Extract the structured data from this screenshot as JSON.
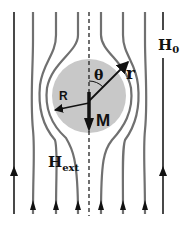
{
  "diagram": {
    "labels": {
      "applied_field": "H",
      "applied_field_sub": "0",
      "external_field": "H",
      "external_field_sub": "ext",
      "magnetization": "M",
      "sphere_radius": "R",
      "position_vector": "r",
      "polar_angle": "θ"
    },
    "colors": {
      "sphere_fill": "#c8c8c8",
      "field_line": "#6f6f6f",
      "outer_line": "#1a1a1a",
      "arrow": "#111111",
      "axis": "#222222"
    },
    "sphere": {
      "cx": 89,
      "cy": 96,
      "r": 37
    }
  }
}
